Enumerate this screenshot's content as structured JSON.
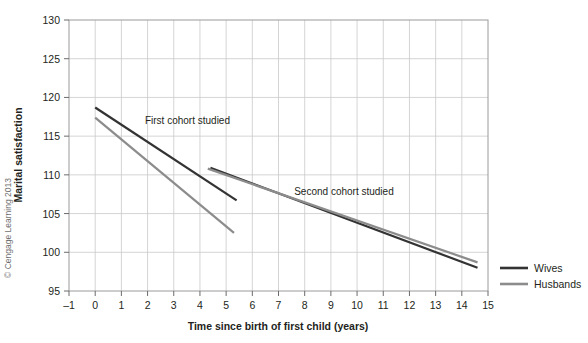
{
  "chart_data": {
    "type": "line",
    "title": "",
    "xlabel": "Time since birth of first child (years)",
    "ylabel": "Marital satisfaction",
    "xlim": [
      -1,
      15
    ],
    "ylim": [
      95,
      130
    ],
    "xticks": [
      "-1",
      "0",
      "1",
      "2",
      "3",
      "4",
      "5",
      "6",
      "7",
      "8",
      "9",
      "10",
      "11",
      "12",
      "13",
      "14",
      "15"
    ],
    "yticks": [
      "95",
      "100",
      "105",
      "110",
      "115",
      "120",
      "125",
      "130"
    ],
    "grid": true,
    "legend_position": "right",
    "series": [
      {
        "name": "Wives",
        "color": "#333333",
        "cohort": "first",
        "points": [
          [
            0,
            118.7
          ],
          [
            5.4,
            106.7
          ]
        ]
      },
      {
        "name": "Husbands",
        "color": "#8c8c8c",
        "cohort": "first",
        "points": [
          [
            0,
            117.4
          ],
          [
            5.3,
            102.5
          ]
        ]
      },
      {
        "name": "Wives",
        "color": "#333333",
        "cohort": "second",
        "points": [
          [
            4.4,
            110.9
          ],
          [
            14.6,
            98.0
          ]
        ]
      },
      {
        "name": "Husbands",
        "color": "#8c8c8c",
        "cohort": "second",
        "points": [
          [
            4.3,
            110.8
          ],
          [
            14.6,
            98.7
          ]
        ]
      }
    ],
    "annotations": [
      {
        "text": "First cohort studied",
        "x": 1.9,
        "y": 116.6
      },
      {
        "text": "Second cohort studied",
        "x": 7.6,
        "y": 107.4
      }
    ]
  },
  "legend": {
    "items": [
      {
        "label": "Wives",
        "color": "#333333"
      },
      {
        "label": "Husbands",
        "color": "#8c8c8c"
      }
    ]
  },
  "credit": {
    "text": "© Cengage Learning 2013"
  },
  "axes": {
    "x_title": "Time since birth of first child (years)",
    "y_title": "Marital satisfaction"
  }
}
